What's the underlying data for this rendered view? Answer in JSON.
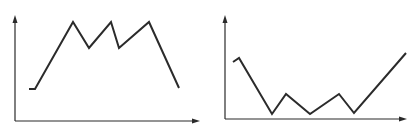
{
  "chart_data": [
    {
      "type": "line",
      "title": "",
      "xlabel": "",
      "ylabel": "",
      "grid": false,
      "legend": null,
      "axis_style": "arrow-axes, no ticks, no labels",
      "description": "Rises from a low flat start to three equal peaks separated by two dips, then falls",
      "x": [
        0,
        1,
        2,
        3,
        4,
        5,
        6,
        7
      ],
      "values": [
        0.3,
        0.3,
        1.0,
        0.73,
        1.0,
        0.73,
        1.0,
        0.31
      ],
      "pixel_points": [
        [
          29,
          89
        ],
        [
          35,
          89
        ],
        [
          73,
          22
        ],
        [
          89,
          48
        ],
        [
          111,
          22
        ],
        [
          119,
          48
        ],
        [
          149,
          22
        ],
        [
          179,
          88
        ]
      ],
      "axes": {
        "origin": [
          15,
          121
        ],
        "y_top": [
          15,
          15
        ],
        "x_right": [
          200,
          121
        ]
      }
    },
    {
      "type": "line",
      "title": "",
      "xlabel": "",
      "ylabel": "",
      "grid": false,
      "legend": null,
      "axis_style": "arrow-axes, no ticks, no labels",
      "description": "Starts mid-high with a small hook, drops to a trough, oscillates along the bottom with two small peaks, then rises steeply to the highest point",
      "x": [
        0,
        1,
        2,
        3,
        4,
        5,
        6,
        7
      ],
      "values": [
        0.58,
        0.62,
        0.05,
        0.25,
        0.05,
        0.25,
        0.06,
        0.66
      ],
      "pixel_points": [
        [
          233,
          62
        ],
        [
          239,
          58
        ],
        [
          272,
          114
        ],
        [
          286,
          94
        ],
        [
          310,
          114
        ],
        [
          339,
          94
        ],
        [
          354,
          113
        ],
        [
          406,
          53
        ]
      ],
      "axes": {
        "origin": [
          225,
          119
        ],
        "y_top": [
          225,
          15
        ],
        "x_right": [
          407,
          119
        ]
      }
    }
  ]
}
